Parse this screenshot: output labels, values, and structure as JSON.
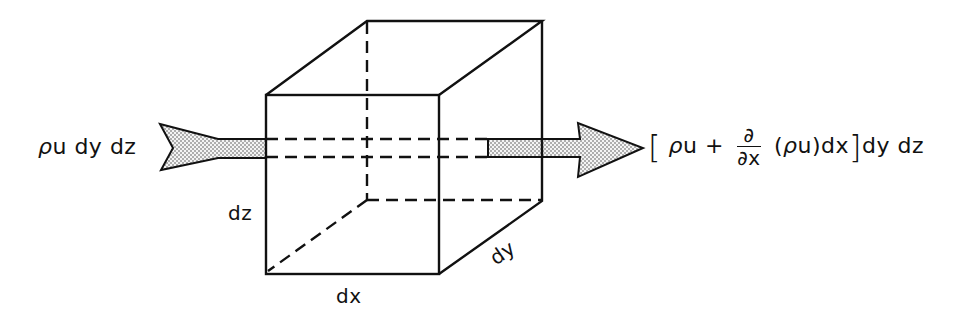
{
  "diagram": {
    "type": "control-volume-mass-flux",
    "inflow_label": {
      "rho": "ρ",
      "rest": "u dy dz"
    },
    "outflow_label": {
      "open_bracket": "[",
      "rho1": "ρ",
      "term1": "u +",
      "frac_num": "∂",
      "frac_den": "∂x",
      "paren_open": "(",
      "rho2": "ρ",
      "paren_rest": "u)dx",
      "close_bracket": "]",
      "tail": "dy dz"
    },
    "dimension_labels": {
      "dz": "dz",
      "dx": "dx",
      "dy": "dy"
    },
    "colors": {
      "stroke": "#111111",
      "arrow_fill": "#cfcfcf",
      "background": "#ffffff"
    }
  }
}
